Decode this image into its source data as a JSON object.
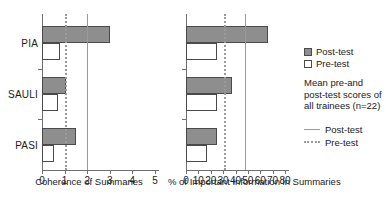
{
  "chart_data": [
    {
      "type": "bar",
      "orientation": "horizontal",
      "panel": "left",
      "title": "",
      "xlabel": "Coherence of Summaries",
      "ylabel": "",
      "categories": [
        "PIA",
        "SAULI",
        "PASI"
      ],
      "series": [
        {
          "name": "Post-test",
          "values": [
            3.0,
            1.05,
            1.5
          ],
          "color": "#8e8e8e"
        },
        {
          "name": "Pre-test",
          "values": [
            0.8,
            0.7,
            0.55
          ],
          "color": "#ffffff"
        }
      ],
      "xlim": [
        0,
        5
      ],
      "xticks": [
        0,
        1,
        2,
        3,
        4,
        5
      ],
      "xticklabels": [
        "0",
        "1",
        "2",
        "3",
        "4",
        "5"
      ],
      "grid": false,
      "reference_lines": [
        {
          "name": "Post-test mean",
          "value": 2.0,
          "style": "solid",
          "color": "#9a9a9a"
        },
        {
          "name": "Pre-test mean",
          "value": 1.0,
          "style": "dotted",
          "color": "#9a9a9a"
        }
      ]
    },
    {
      "type": "bar",
      "orientation": "horizontal",
      "panel": "right",
      "title": "",
      "xlabel": "% of Important Information in Summaries",
      "ylabel": "",
      "categories": [
        "PIA",
        "SAULI",
        "PASI"
      ],
      "series": [
        {
          "name": "Post-test",
          "values": [
            66,
            37,
            25
          ],
          "color": "#8e8e8e"
        },
        {
          "name": "Pre-test",
          "values": [
            25,
            25,
            17
          ],
          "color": "#ffffff"
        }
      ],
      "xlim": [
        0,
        80
      ],
      "xticks": [
        0,
        10,
        20,
        30,
        40,
        50,
        60,
        70,
        80
      ],
      "xticklabels": [
        "0",
        "10",
        "20",
        "30",
        "40",
        "50",
        "60",
        "70",
        "80"
      ],
      "grid": false,
      "reference_lines": [
        {
          "name": "Post-test mean",
          "value": 48,
          "style": "solid",
          "color": "#9a9a9a"
        },
        {
          "name": "Pre-test mean",
          "value": 31,
          "style": "dotted",
          "color": "#9a9a9a"
        }
      ]
    }
  ],
  "legend": {
    "position": "right",
    "swatches": [
      {
        "label": "Post-test",
        "fill": "#8e8e8e"
      },
      {
        "label": "Pre-test",
        "fill": "#ffffff"
      }
    ],
    "note": "Mean pre-and post-test scores of all trainees (n=22)",
    "lines": [
      {
        "label": "Post-test",
        "style": "solid"
      },
      {
        "label": "Pre-test",
        "style": "dotted"
      }
    ]
  }
}
